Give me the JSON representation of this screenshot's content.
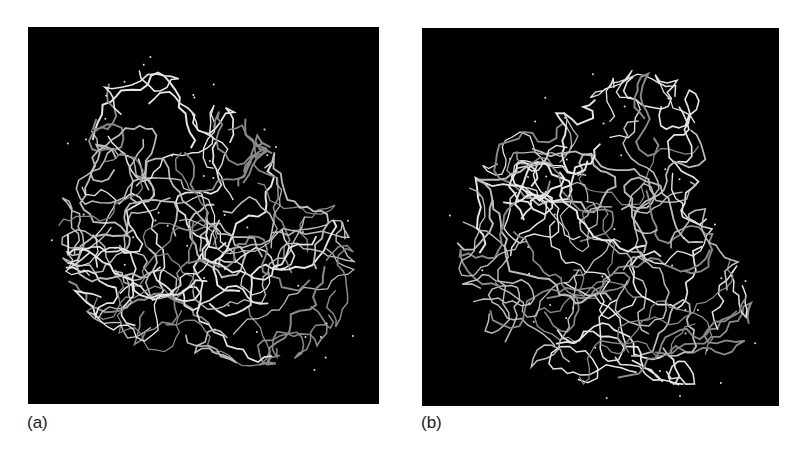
{
  "figure": {
    "panels": [
      {
        "id": "a",
        "label": "(a)",
        "content": "protein-structure-stick-render",
        "background": "#000000",
        "stroke_colors": [
          "#8a8a8a",
          "#bdbdbd",
          "#e6e6e6"
        ]
      },
      {
        "id": "b",
        "label": "(b)",
        "content": "protein-structure-stick-render",
        "background": "#000000",
        "stroke_colors": [
          "#8a8a8a",
          "#bdbdbd",
          "#e6e6e6"
        ]
      }
    ]
  }
}
